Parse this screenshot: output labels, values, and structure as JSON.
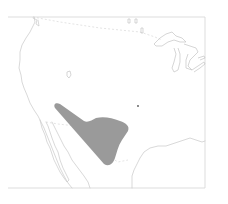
{
  "map": {
    "type": "species-range-map",
    "region": "Southwestern United States and Northern Mexico",
    "colors": {
      "background": "#ffffff",
      "outline": "#c8c8c8",
      "range_fill": "#9a9a9a"
    },
    "range_area": {
      "label": "range",
      "approx_vertices_px": [
        [
          55,
          106
        ],
        [
          84,
          124
        ],
        [
          100,
          118
        ],
        [
          125,
          125
        ],
        [
          128,
          131
        ],
        [
          118,
          150
        ],
        [
          110,
          165
        ],
        [
          103,
          166
        ]
      ]
    },
    "marker": {
      "label": "isolated record",
      "position_px": [
        138,
        106
      ]
    }
  }
}
